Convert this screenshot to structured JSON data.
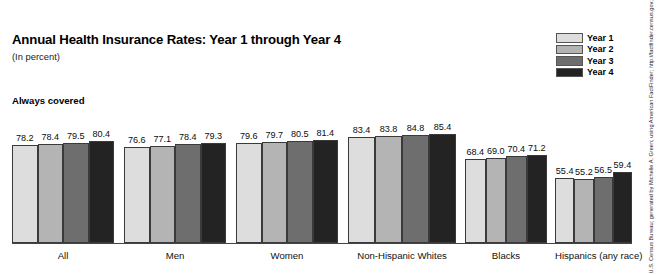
{
  "chart_data": {
    "type": "bar",
    "title": "Annual Health Insurance Rates: Year 1 through Year 4",
    "subtitle": "(In percent)",
    "series_header": "Always covered",
    "xlabel": "",
    "ylabel": "",
    "ylim": [
      0,
      100
    ],
    "grid": false,
    "legend_position": "top-right",
    "categories": [
      "All",
      "Men",
      "Women",
      "Non-Hispanic Whites",
      "Blacks",
      "Hispanics (any race)"
    ],
    "series": [
      {
        "name": "Year 1",
        "color": "#dddddd",
        "values": [
          78.2,
          76.6,
          79.6,
          83.4,
          68.4,
          55.4
        ]
      },
      {
        "name": "Year 2",
        "color": "#b4b4b4",
        "values": [
          78.4,
          77.1,
          79.7,
          83.8,
          69.0,
          55.2
        ]
      },
      {
        "name": "Year 3",
        "color": "#6e6e6e",
        "values": [
          79.5,
          78.4,
          80.5,
          84.8,
          70.4,
          56.5
        ]
      },
      {
        "name": "Year 4",
        "color": "#232323",
        "values": [
          80.4,
          79.3,
          81.4,
          85.4,
          71.2,
          59.4
        ]
      }
    ],
    "source_note": "U.S. Census Bureau; generated by Michelle A. Green; using American FactFinder; http://factfinder.census.gov; (20 September 2011)."
  }
}
